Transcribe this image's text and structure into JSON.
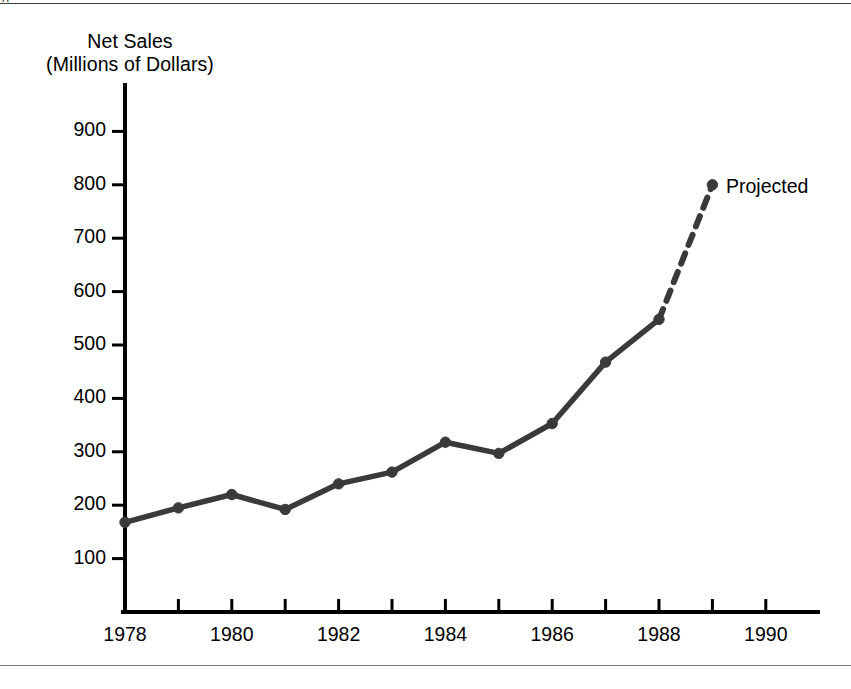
{
  "figure": {
    "clipped_caption_above": "g",
    "background_color": "#ffffff",
    "rule_color": "#5a5a5a"
  },
  "chart_data": {
    "type": "line",
    "title": "Net Sales (Millions of Dollars)",
    "title_line_1": "Net Sales",
    "title_line_2": "(Millions of Dollars)",
    "xlabel": "",
    "ylabel": "Net Sales (Millions of Dollars)",
    "xlim": [
      1977.7,
      1990.9
    ],
    "ylim": [
      0,
      960
    ],
    "grid": false,
    "legend": false,
    "line_color": "#3a3a3a",
    "axis_color": "#000000",
    "x": [
      1978,
      1979,
      1980,
      1981,
      1982,
      1983,
      1984,
      1985,
      1986,
      1987,
      1988,
      1989
    ],
    "values": [
      168,
      195,
      220,
      192,
      240,
      262,
      318,
      297,
      353,
      468,
      548,
      800
    ],
    "series": [
      {
        "name": "Net Sales",
        "style": "solid",
        "x": [
          1978,
          1979,
          1980,
          1981,
          1982,
          1983,
          1984,
          1985,
          1986,
          1987,
          1988
        ],
        "values": [
          168,
          195,
          220,
          192,
          240,
          262,
          318,
          297,
          353,
          468,
          548
        ]
      },
      {
        "name": "Projected",
        "style": "dashed",
        "x": [
          1988,
          1989
        ],
        "values": [
          548,
          800
        ]
      }
    ],
    "annotations": [
      {
        "text": "Projected",
        "x": 1989,
        "y": 800
      }
    ],
    "y_ticks": [
      100,
      200,
      300,
      400,
      500,
      600,
      700,
      800,
      900
    ],
    "y_tick_labels": [
      "100",
      "200",
      "300",
      "400",
      "500",
      "600",
      "700",
      "800",
      "900"
    ],
    "x_ticks": [
      1978,
      1979,
      1980,
      1981,
      1982,
      1983,
      1984,
      1985,
      1986,
      1987,
      1988,
      1989,
      1990
    ],
    "x_tick_labels_shown": [
      "1978",
      "1980",
      "1982",
      "1984",
      "1986",
      "1988",
      "1990"
    ],
    "x_labeled_ticks": [
      1978,
      1980,
      1982,
      1984,
      1986,
      1988,
      1990
    ]
  },
  "labels": {
    "projected": "Projected"
  }
}
